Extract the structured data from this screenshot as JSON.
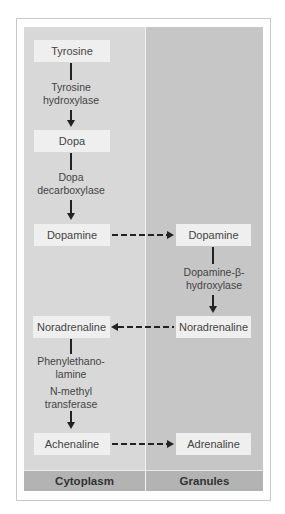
{
  "diagram": {
    "compartments": [
      {
        "id": "cytoplasm",
        "label": "Cytoplasm"
      },
      {
        "id": "granules",
        "label": "Granules"
      }
    ],
    "nodes": {
      "tyrosine": "Tyrosine",
      "dopa": "Dopa",
      "dopamine_cyto": "Dopamine",
      "dopamine_gran": "Dopamine",
      "noradrenaline_gran": "Noradrenaline",
      "noradrenaline_cyto": "Noradrenaline",
      "achenaline": "Achenaline",
      "adrenaline": "Adrenaline"
    },
    "enzymes": {
      "tyrosine_hydroxylase": [
        "Tyrosine",
        "hydroxylase"
      ],
      "dopa_decarboxylase": [
        "Dopa",
        "decarboxylase"
      ],
      "dopamine_beta_hydroxylase": [
        "Dopamine-β-",
        "hydroxylase"
      ],
      "pnmt": [
        "Phenylethano-",
        "lamine",
        "N-methyl",
        "transferase"
      ]
    },
    "edges": [
      {
        "from": "tyrosine",
        "to": "dopa",
        "style": "solid",
        "enzyme": "tyrosine_hydroxylase"
      },
      {
        "from": "dopa",
        "to": "dopamine_cyto",
        "style": "solid",
        "enzyme": "dopa_decarboxylase"
      },
      {
        "from": "dopamine_cyto",
        "to": "dopamine_gran",
        "style": "dashed"
      },
      {
        "from": "dopamine_gran",
        "to": "noradrenaline_gran",
        "style": "solid",
        "enzyme": "dopamine_beta_hydroxylase"
      },
      {
        "from": "noradrenaline_gran",
        "to": "noradrenaline_cyto",
        "style": "dashed"
      },
      {
        "from": "noradrenaline_cyto",
        "to": "achenaline",
        "style": "solid",
        "enzyme": "pnmt"
      },
      {
        "from": "achenaline",
        "to": "adrenaline",
        "style": "dashed"
      }
    ],
    "colors": {
      "cytoplasm_bg": "#d8d8d8",
      "granules_bg": "#c6c6c6",
      "footer_bg": "#b3b3b3",
      "box_bg": "#efefef",
      "arrow": "#222222"
    }
  }
}
